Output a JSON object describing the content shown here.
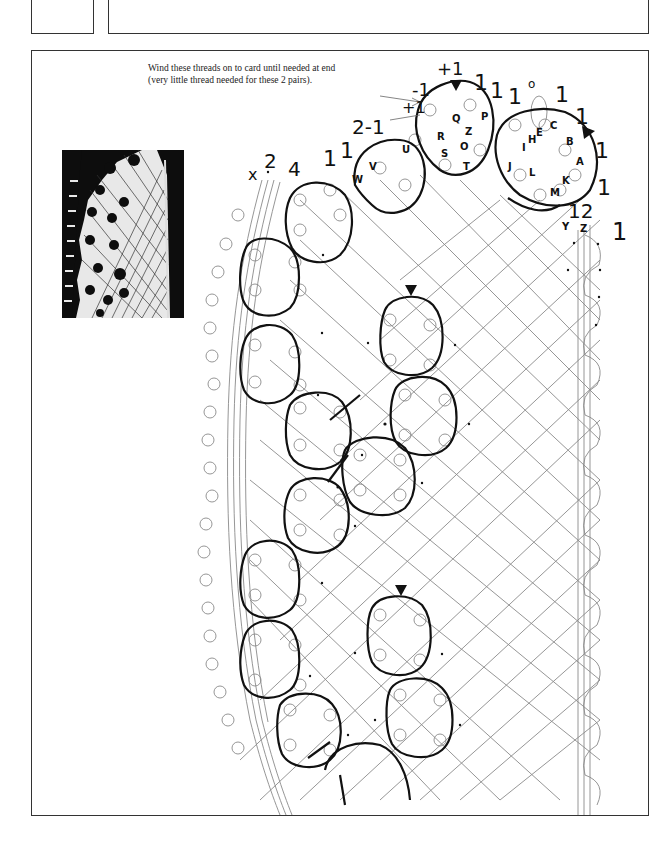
{
  "header": {
    "left_box": {
      "label": ""
    },
    "right_box": {
      "label": ""
    }
  },
  "caption": {
    "line1": "Wind these threads on to card until needed at end",
    "line2": "(very little thread needed for these 2 pairs)."
  },
  "photo": {
    "alt": "lace sample photograph"
  },
  "pair_numbers_top": [
    {
      "text": "x",
      "x": 248,
      "y": 180,
      "size": 16
    },
    {
      "text": "2",
      "x": 264,
      "y": 168,
      "size": 20
    },
    {
      "text": "4",
      "x": 288,
      "y": 176,
      "size": 20
    },
    {
      "text": "1",
      "x": 323,
      "y": 166,
      "size": 22
    },
    {
      "text": "1",
      "x": 340,
      "y": 158,
      "size": 22
    },
    {
      "text": "2-1",
      "x": 352,
      "y": 134,
      "size": 20
    },
    {
      "text": "+1",
      "x": 402,
      "y": 113,
      "size": 16
    },
    {
      "text": "-1",
      "x": 412,
      "y": 96,
      "size": 18
    },
    {
      "text": "+1",
      "x": 437,
      "y": 75,
      "size": 18
    },
    {
      "text": "1",
      "x": 474,
      "y": 90,
      "size": 22
    },
    {
      "text": "1",
      "x": 490,
      "y": 98,
      "size": 22
    },
    {
      "text": "1",
      "x": 508,
      "y": 104,
      "size": 22
    },
    {
      "text": "o",
      "x": 528,
      "y": 88,
      "size": 12
    },
    {
      "text": "1",
      "x": 555,
      "y": 102,
      "size": 22
    },
    {
      "text": "1",
      "x": 575,
      "y": 124,
      "size": 22
    },
    {
      "text": "1",
      "x": 595,
      "y": 158,
      "size": 22
    },
    {
      "text": "1",
      "x": 597,
      "y": 195,
      "size": 22
    },
    {
      "text": "12",
      "x": 568,
      "y": 218,
      "size": 20
    },
    {
      "text": "1",
      "x": 612,
      "y": 240,
      "size": 24
    }
  ],
  "bobbin_letters": [
    {
      "text": "W",
      "x": 352,
      "y": 183
    },
    {
      "text": "V",
      "x": 369,
      "y": 170
    },
    {
      "text": "U",
      "x": 402,
      "y": 153
    },
    {
      "text": "Q",
      "x": 452,
      "y": 122
    },
    {
      "text": "P",
      "x": 481,
      "y": 120
    },
    {
      "text": "R",
      "x": 437,
      "y": 140
    },
    {
      "text": "Z",
      "x": 465,
      "y": 135
    },
    {
      "text": "S",
      "x": 441,
      "y": 157
    },
    {
      "text": "O",
      "x": 460,
      "y": 150
    },
    {
      "text": "T",
      "x": 463,
      "y": 170
    },
    {
      "text": "I",
      "x": 522,
      "y": 151
    },
    {
      "text": "H",
      "x": 528,
      "y": 143
    },
    {
      "text": "E",
      "x": 536,
      "y": 136
    },
    {
      "text": "C",
      "x": 550,
      "y": 129
    },
    {
      "text": "B",
      "x": 566,
      "y": 145
    },
    {
      "text": "A",
      "x": 576,
      "y": 165
    },
    {
      "text": "J",
      "x": 508,
      "y": 170
    },
    {
      "text": "L",
      "x": 529,
      "y": 176
    },
    {
      "text": "K",
      "x": 562,
      "y": 184
    },
    {
      "text": "M",
      "x": 550,
      "y": 196
    },
    {
      "text": "Y",
      "x": 562,
      "y": 230
    },
    {
      "text": "Z",
      "x": 580,
      "y": 232
    }
  ],
  "markers": [
    {
      "name": "triangle-top-left",
      "x": 456,
      "y": 81
    },
    {
      "name": "triangle-top-right",
      "x": 587,
      "y": 130
    },
    {
      "name": "triangle-mid",
      "x": 411,
      "y": 290
    },
    {
      "name": "triangle-low",
      "x": 401,
      "y": 590
    }
  ],
  "colors": {
    "frame": "#333333",
    "thread": "#8a8a8a",
    "outline": "#111111",
    "photo_bg": "#0d0d0d"
  }
}
